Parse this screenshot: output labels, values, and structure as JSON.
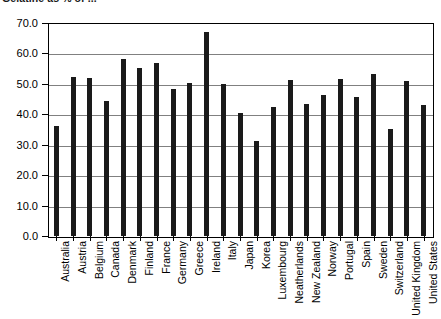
{
  "chart_data": {
    "type": "bar",
    "title": "Gelatine as % of ...",
    "xlabel": "",
    "ylabel": "",
    "ylim": [
      0.0,
      70.0
    ],
    "ytick_step": 10.0,
    "ytick_labels": [
      "0.0",
      "10.0",
      "20.0",
      "30.0",
      "40.0",
      "50.0",
      "60.0",
      "70.0"
    ],
    "grid": true,
    "legend": false,
    "bar_color": "#1a1a1a",
    "categories": [
      "Australia",
      "Austria",
      "Belgium",
      "Canada",
      "Denmark",
      "Finland",
      "France",
      "Germany",
      "Greece",
      "Ireland",
      "Italy",
      "Japan",
      "Korea",
      "Luxembourg",
      "Neatherlands",
      "New Zealand",
      "Norway",
      "Portugal",
      "Spain",
      "Sweden",
      "Switzerland",
      "United Kingdom",
      "United States"
    ],
    "values": [
      36.2,
      52.3,
      51.8,
      44.3,
      58.3,
      55.2,
      56.7,
      48.2,
      50.2,
      67.0,
      50.0,
      40.3,
      31.2,
      42.5,
      51.3,
      43.5,
      46.5,
      51.7,
      45.8,
      53.1,
      35.3,
      50.8,
      43.0
    ]
  }
}
